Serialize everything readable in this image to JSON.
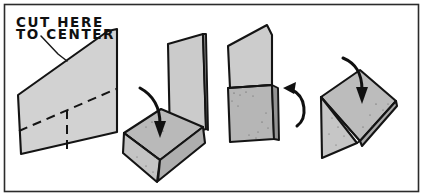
{
  "figure": {
    "background_color": "#ffffff",
    "frame_color": "#2b2b2b",
    "ink_color": "#141414",
    "paper_fill_light": "#d2d2d2",
    "paper_fill_mid": "#b9b9b9",
    "paper_fill_dark": "#a8a8a8",
    "paper_fill_edge": "#8f8f8f"
  },
  "annotations": {
    "cut_instruction_line1": "CUT HERE",
    "cut_instruction_line2": "TO CENTER",
    "leader_label": "leader-line-to-sheet-edge"
  },
  "steps": [
    {
      "index": 1,
      "name": "flat-sheet-with-cut-lines",
      "description": "Flat rectangular sheet shown in perspective with dashed horizontal fold line and dashed vertical cut line descending to the bottom edge",
      "has_arrow": false,
      "fold_line_count": 2
    },
    {
      "index": 2,
      "name": "first-fold-flap-down",
      "description": "Sheet partly folded: one panel stands upright, the cut flap is folded forward and down toward the viewer",
      "has_arrow": true,
      "arrow_direction": "down",
      "fold_line_count": 1
    },
    {
      "index": 3,
      "name": "upright-folded-form",
      "description": "Form seen from the front: upper flap tilted back, lower square box closed, side edge visible",
      "has_arrow": true,
      "arrow_direction": "up-left",
      "fold_line_count": 1
    },
    {
      "index": 4,
      "name": "flattened-final-fold",
      "description": "Final flattened trapezoidal shape with triangular side flap and a centre crease",
      "has_arrow": true,
      "arrow_direction": "down",
      "fold_line_count": 1
    }
  ],
  "arrows": [
    {
      "name": "arrow-step-2",
      "direction": "down",
      "meaning": "fold this flap downward"
    },
    {
      "name": "arrow-step-3",
      "direction": "up-left",
      "meaning": "rotate / view from this side"
    },
    {
      "name": "arrow-step-4",
      "direction": "down",
      "meaning": "press flat downward"
    }
  ]
}
